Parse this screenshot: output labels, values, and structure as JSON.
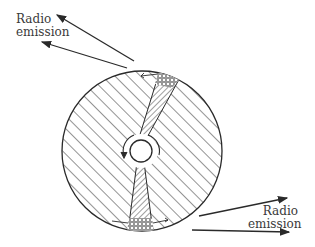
{
  "diagram": {
    "type": "pulsar-beam-schematic",
    "colors": {
      "line": "#2a2a2a",
      "background": "#ffffff",
      "text": "#3a3a3a"
    },
    "labels": {
      "top_left": {
        "line1": "Radio",
        "line2": "emission"
      },
      "bottom_right": {
        "line1": "Radio",
        "line2": "emission"
      }
    },
    "elements": {
      "star_disk": "hatched circle (neutron star body)",
      "core": "small central circle with rotation arrow",
      "beams": [
        "upper emission cone (cross-hatched)",
        "lower emission cone (cross-hatched)"
      ],
      "arrows": [
        "two arrows to upper-left",
        "two arrows to lower-right"
      ]
    }
  }
}
